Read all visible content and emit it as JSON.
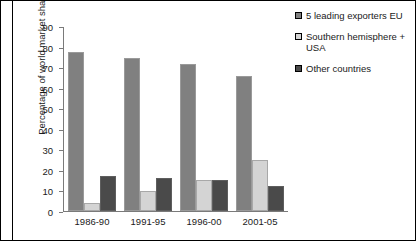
{
  "chart_data": {
    "type": "bar",
    "title": "",
    "xlabel": "",
    "ylabel": "Percentage of world market share",
    "ylim": [
      0,
      90
    ],
    "ytick_step": 10,
    "yticks": [
      90,
      80,
      70,
      60,
      50,
      40,
      30,
      20,
      10,
      0
    ],
    "grid": false,
    "legend_position": "right",
    "categories": [
      "1986-90",
      "1991-95",
      "1996-00",
      "2001-05"
    ],
    "series": [
      {
        "name": "5 leading exporters EU",
        "color": "#808080",
        "values": [
          78,
          75,
          72,
          66
        ]
      },
      {
        "name": "Southern hemisphere + USA",
        "color": "#d4d4d4",
        "values": [
          4,
          10,
          15,
          25
        ]
      },
      {
        "name": "Other countries",
        "color": "#4a4a4a",
        "values": [
          17,
          16,
          15,
          12
        ]
      }
    ]
  },
  "legend": {
    "items": [
      {
        "label": "5 leading exporters EU",
        "swatch_name": "legend-swatch-5-leading-exporters-eu"
      },
      {
        "label": "Southern hemisphere + USA",
        "swatch_name": "legend-swatch-southern-hemisphere-usa"
      },
      {
        "label": "Other countries",
        "swatch_name": "legend-swatch-other-countries"
      }
    ]
  }
}
